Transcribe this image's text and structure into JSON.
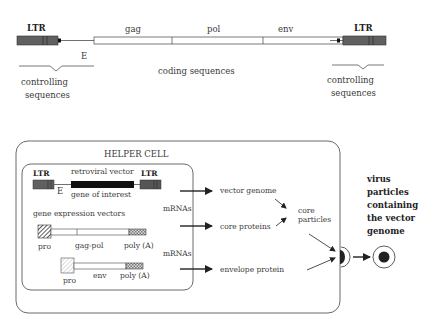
{
  "top_construct": {
    "ltr_left": "LTR",
    "ltr_right": "LTR",
    "gag": "gag",
    "pol": "pol",
    "env": "env",
    "e_label": "E",
    "coding": "coding sequences",
    "controlling_left_1": "controlling",
    "controlling_left_2": "sequences",
    "controlling_right_1": "controlling",
    "controlling_right_2": "sequences"
  },
  "helper_cell": {
    "title": "HELPER CELL",
    "retroviral": {
      "ltr_left": "LTR",
      "ltr_right": "LTR",
      "title": "retroviral vector",
      "e_label": "E",
      "gene": "gene of interest"
    },
    "gene_expression_title": "gene expression vectors",
    "vector1": {
      "pro": "pro",
      "gene": "gag-pol",
      "polya": "poly (A)"
    },
    "vector2": {
      "pro": "pro",
      "gene": "env",
      "polya": "poly (A)"
    },
    "mrnas_1": "mRNAs",
    "mrnas_2": "mRNAs",
    "products": {
      "vector_genome": "vector genome",
      "core_proteins": "core proteins",
      "envelope_protein": "envelope protein",
      "core_particles_1": "core",
      "core_particles_2": "particles"
    }
  },
  "output": {
    "line1": "virus",
    "line2": "particles",
    "line3": "containing",
    "line4": "the vector",
    "line5": "genome"
  },
  "colors": {
    "ltr_fill": "#555555",
    "gene_fill": "#111111",
    "stroke": "#333333"
  }
}
